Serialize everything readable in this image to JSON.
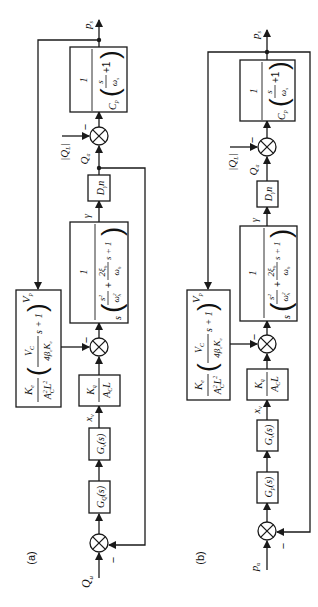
{
  "diagram": {
    "rotation": "rotated 90 degrees counter-clockwise",
    "panels": [
      {
        "id": "a",
        "label": "(a)",
        "input": "Q_u",
        "output": "p_s",
        "blocks": {
          "controller": "G_Q(s)",
          "valve": "G_v(s)",
          "valve_gain": {
            "num": "K_q",
            "den": "A_C L"
          },
          "leakage": {
            "num": "K_e",
            "den": "A_C^2 L^2",
            "factor": "(V_C / (4 β_e K_e) s + 1)",
            "output": "V_p"
          },
          "actuator": {
            "num": "1",
            "den": "s (s^2/ω_h^2 + 2ξ_h/ω_h s + 1)"
          },
          "pump": "D_γ n",
          "chamber": {
            "num": "1",
            "den": "C_p (s/ω_s + 1)"
          }
        },
        "signals": {
          "valve_pos": "x_v",
          "angle": "γ",
          "flow": "Q_a",
          "load_flow": "|Q_L|",
          "minus": "−"
        }
      },
      {
        "id": "b",
        "label": "(b)",
        "input": "p_u",
        "output": "p_s",
        "blocks": {
          "controller": "G_p(s)",
          "valve": "G_v(s)",
          "valve_gain": {
            "num": "K_q",
            "den": "A_C L"
          },
          "leakage": {
            "num": "K_e",
            "den": "A_C^2 L^2",
            "factor": "(V_C / (4 β_e K_e) s + 1)",
            "output": "V_p"
          },
          "actuator": {
            "num": "1",
            "den": "s (s^2/ω_h^2 + 2ξ_h/ω_h s + 1)"
          },
          "pump": "D_γ n",
          "chamber": {
            "num": "1",
            "den": "C_p (s/ω_s + 1)"
          }
        },
        "signals": {
          "valve_pos": "x_v",
          "angle": "γ",
          "flow": "Q_a",
          "load_flow": "|Q_L|",
          "minus": "−"
        }
      }
    ],
    "text": {
      "a_label": "(a)",
      "b_label": "(b)",
      "Qu": "Q",
      "Qu_sub": "u",
      "pu": "p",
      "pu_sub": "u",
      "ps": "p",
      "ps_sub": "s",
      "GQ": "G",
      "GQ_sub": "Q",
      "Gp": "G",
      "Gp_sub": "p",
      "Gv": "G",
      "Gv_sub": "v",
      "s_arg": "(s)",
      "xv": "x",
      "xv_sub": "v",
      "Kq": "K",
      "Kq_sub": "q",
      "AcL": "A",
      "AcL_sub": "C",
      "AcL_tail": "L",
      "Ke": "K",
      "Ke_sub": "e",
      "Ac2L2": "A",
      "Ac2L2_sup": "2",
      "Ac2L2_sub": "C",
      "Ac2L2_L": "L",
      "Ac2L2_L_sup": "2",
      "VC": "V",
      "VC_sub": "C",
      "beta": "4β",
      "beta_sub": "e",
      "beta_K": "K",
      "beta_K_sub": "e",
      "s_plus_1": "s + 1",
      "Vp": "V",
      "Vp_sub": "p",
      "one": "1",
      "s": "s",
      "s2": "s",
      "s2_sup": "2",
      "wh2": "ω",
      "wh2_sup": "2",
      "wh2_sub": "h",
      "plus": "+",
      "twoxi": "2ξ",
      "twoxi_sub": "h",
      "wh": "ω",
      "wh_sub": "h",
      "s1": "s + 1",
      "gamma": "γ",
      "Dgn": "D",
      "Dgn_sub": "γ",
      "Dgn_tail": "n",
      "Qa": "Q",
      "Qa_sub": "a",
      "QL": "|Q",
      "QL_sub": "L",
      "QL_tail": "|",
      "minus": "−",
      "Cp": "C",
      "Cp_sub": "p",
      "s_over": "s",
      "ws": "ω",
      "ws_sub": "s",
      "plus1": "+1"
    }
  }
}
